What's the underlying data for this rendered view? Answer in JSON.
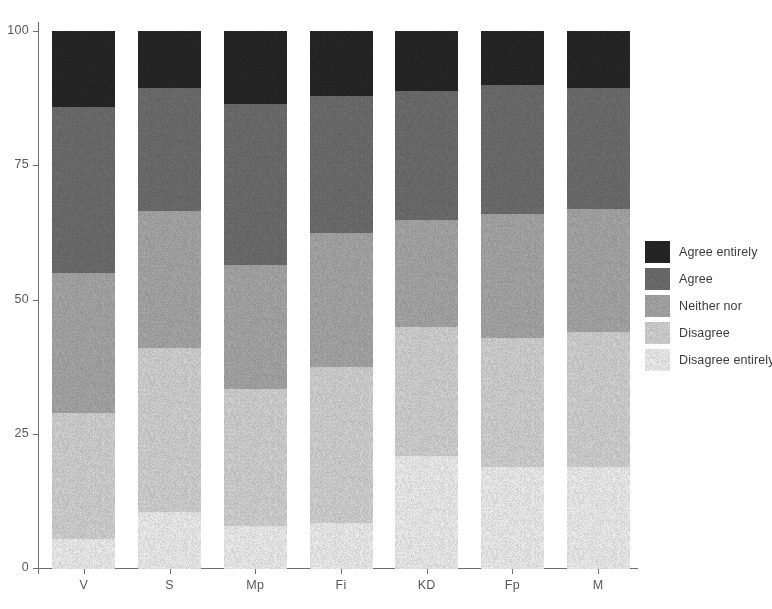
{
  "chart_data": {
    "type": "bar",
    "subtype": "stacked-percent",
    "title": "",
    "xlabel": "",
    "ylabel": "",
    "ylim": [
      0,
      100
    ],
    "ytick_labels": [
      "0",
      "25",
      "50",
      "75",
      "100"
    ],
    "yticks": [
      0,
      25,
      50,
      75,
      100
    ],
    "grid": false,
    "legend_position": "right",
    "categories": [
      "V",
      "S",
      "Mp",
      "Fi",
      "KD",
      "Fp",
      "M"
    ],
    "series": [
      {
        "name": "Agree entirely",
        "color": "#262626",
        "values": [
          14.0,
          10.5,
          13.5,
          12.0,
          11.0,
          10.0,
          10.5
        ]
      },
      {
        "name": "Agree",
        "color": "#6e6e6e",
        "values": [
          31.0,
          23.0,
          30.0,
          25.5,
          24.0,
          24.0,
          22.5
        ]
      },
      {
        "name": "Neither nor",
        "color": "#a8a8a8",
        "values": [
          26.0,
          25.5,
          23.0,
          25.0,
          20.0,
          23.0,
          23.0
        ]
      },
      {
        "name": "Disagree",
        "color": "#d4d4d4",
        "values": [
          23.5,
          30.5,
          25.5,
          29.0,
          24.0,
          24.0,
          25.0
        ]
      },
      {
        "name": "Disagree entirely",
        "color": "#f0f0f0",
        "values": [
          5.5,
          10.5,
          8.0,
          8.5,
          21.0,
          19.0,
          19.0
        ]
      }
    ]
  },
  "legend": {
    "items": [
      {
        "label": "Agree entirely",
        "color": "#262626"
      },
      {
        "label": "Agree",
        "color": "#6e6e6e"
      },
      {
        "label": "Neither nor",
        "color": "#a8a8a8"
      },
      {
        "label": "Disagree",
        "color": "#d4d4d4"
      },
      {
        "label": "Disagree entirely",
        "color": "#f0f0f0"
      }
    ]
  },
  "axis": {
    "y_tick_labels": [
      "100",
      "75",
      "50",
      "25",
      "0"
    ],
    "x_tick_labels": [
      "V",
      "S",
      "Mp",
      "Fi",
      "KD",
      "Fp",
      "M"
    ]
  }
}
